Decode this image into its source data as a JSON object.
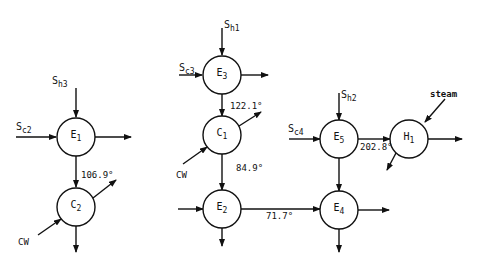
{
  "diagram": {
    "type": "heat-exchanger-network",
    "nodes": [
      {
        "id": "E1",
        "main": "E",
        "sub": "1",
        "cx": 76,
        "cy": 137
      },
      {
        "id": "C2",
        "main": "C",
        "sub": "2",
        "cx": 76,
        "cy": 207
      },
      {
        "id": "E3",
        "main": "E",
        "sub": "3",
        "cx": 222,
        "cy": 75
      },
      {
        "id": "C1",
        "main": "C",
        "sub": "1",
        "cx": 222,
        "cy": 135
      },
      {
        "id": "E2",
        "main": "E",
        "sub": "2",
        "cx": 222,
        "cy": 209
      },
      {
        "id": "E5",
        "main": "E",
        "sub": "5",
        "cx": 339,
        "cy": 139
      },
      {
        "id": "E4",
        "main": "E",
        "sub": "4",
        "cx": 339,
        "cy": 210
      },
      {
        "id": "H1",
        "main": "H",
        "sub": "1",
        "cx": 409,
        "cy": 139
      }
    ],
    "stream_labels": [
      {
        "id": "Sh3",
        "main": "S",
        "sub": "h3",
        "x": 68,
        "y": 76
      },
      {
        "id": "Sc2",
        "main": "S",
        "sub": "c2",
        "x": 16,
        "y": 121
      },
      {
        "id": "Sh1",
        "main": "S",
        "sub": "h1",
        "x": 224,
        "y": 19
      },
      {
        "id": "Sc3",
        "main": "S",
        "sub": "c3",
        "x": 179,
        "y": 62
      },
      {
        "id": "Sh2",
        "main": "S",
        "sub": "h2",
        "x": 341,
        "y": 91
      },
      {
        "id": "Sc4",
        "main": "S",
        "sub": "c4",
        "x": 287,
        "y": 125
      }
    ],
    "text_labels": [
      {
        "id": "cw-left",
        "text": "CW",
        "x": 18,
        "y": 236
      },
      {
        "id": "cw-middle",
        "text": "CW",
        "x": 176,
        "y": 170
      },
      {
        "id": "steam",
        "text": "steam",
        "x": 430,
        "y": 90
      }
    ],
    "temperatures": [
      {
        "id": "t-e1-c2",
        "text": "106.9°",
        "x": 81,
        "y": 170
      },
      {
        "id": "t-e3-c1",
        "text": "122.1°",
        "x": 230,
        "y": 101
      },
      {
        "id": "t-c1-e2",
        "text": "84.9°",
        "x": 236,
        "y": 164
      },
      {
        "id": "t-e2-e4",
        "text": "71.7°",
        "x": 265,
        "y": 211
      },
      {
        "id": "t-e5-h1",
        "text": "202.8°",
        "x": 360,
        "y": 142
      }
    ]
  }
}
